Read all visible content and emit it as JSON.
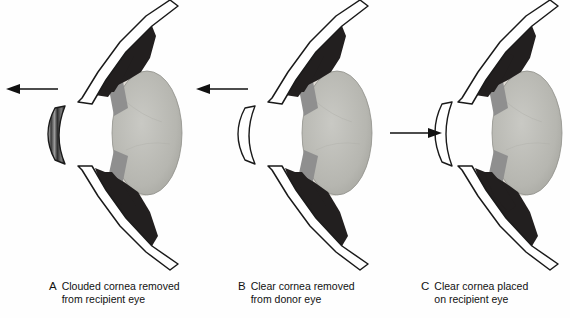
{
  "figure": {
    "background_color": "#fefefe",
    "ink_color": "#111111",
    "panel_count": 3
  },
  "palette": {
    "outline": "#1a1a1a",
    "iris_dark": "#221f1f",
    "lens_gray": "#b8b8b2",
    "ciliary_gray": "#8c8c8c",
    "zonule_light": "#d8d8d4",
    "clouded_cornea_dark": "#2b2b2b",
    "clouded_cornea_mid": "#6e6e6e",
    "clouded_cornea_light": "#cfcfcf",
    "clear_cornea_fill": "#ffffff",
    "sclera_fill": "#ffffff"
  },
  "panels": [
    {
      "id": "a",
      "letter": "A",
      "caption_lines": [
        "Clouded cornea removed",
        "from recipient eye"
      ],
      "arrow": {
        "name": "arrow-left",
        "direction": "left",
        "label": "cornea removed"
      },
      "cornea": {
        "name": "clouded-cornea",
        "state": "clouded",
        "description": "Opaque, shaded crescent cornea detached and moved away from the eye"
      },
      "eye": {
        "name": "recipient-eye",
        "parts": [
          "sclera",
          "iris",
          "ciliary-body",
          "lens",
          "zonules"
        ]
      }
    },
    {
      "id": "b",
      "letter": "B",
      "caption_lines": [
        "Clear cornea removed",
        "from donor eye"
      ],
      "arrow": {
        "name": "arrow-left",
        "direction": "left",
        "label": "cornea removed"
      },
      "cornea": {
        "name": "clear-cornea",
        "state": "clear",
        "description": "Transparent outlined crescent cornea detached and moved away from the donor eye"
      },
      "eye": {
        "name": "donor-eye",
        "parts": [
          "sclera",
          "iris",
          "ciliary-body",
          "lens",
          "zonules"
        ]
      }
    },
    {
      "id": "c",
      "letter": "C",
      "caption_lines": [
        "Clear cornea placed",
        "on recipient eye"
      ],
      "arrow": {
        "name": "arrow-right",
        "direction": "right",
        "label": "cornea placed"
      },
      "cornea": {
        "name": "clear-cornea-graft",
        "state": "clear",
        "description": "Transparent outlined crescent cornea being seated onto the recipient eye"
      },
      "eye": {
        "name": "recipient-eye-with-graft",
        "parts": [
          "sclera",
          "iris",
          "ciliary-body",
          "lens",
          "zonules"
        ]
      }
    }
  ]
}
